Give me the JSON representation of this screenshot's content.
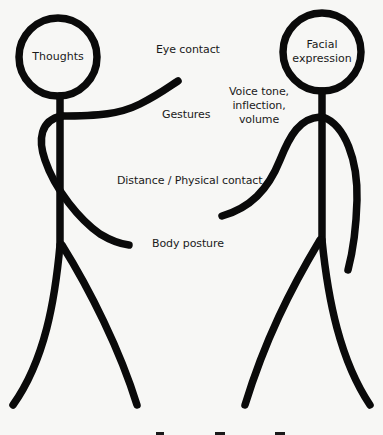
{
  "diagram": {
    "type": "stick-figure communication diagram",
    "left_figure": {
      "head_label": "Thoughts"
    },
    "right_figure": {
      "head_label_line1": "Facial",
      "head_label_line2": "expression"
    },
    "labels": {
      "eye_contact": "Eye contact",
      "gestures": "Gestures",
      "voice_line1": "Voice tone,",
      "voice_line2": "inflection,",
      "voice_line3": "volume",
      "distance": "Distance / Physical contact",
      "body_posture": "Body posture"
    },
    "colors": {
      "stroke": "#0a0a0a",
      "background": "#f7f7f5",
      "text": "#1a1a1a"
    }
  }
}
